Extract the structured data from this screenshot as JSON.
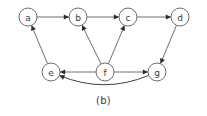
{
  "figure": {
    "caption": "(b)",
    "width": 207,
    "height": 116,
    "background_color": "#ffffff",
    "node_stroke_color": "#6d6d6d",
    "edge_color": "#6f6f6f",
    "arrow_color": "#2b2b2b",
    "label_color": "#3b3b3b"
  },
  "chart_data": {
    "type": "diagram",
    "subtype": "directed-graph",
    "title": "(b)",
    "node_radius": 9,
    "nodes": [
      {
        "id": "a",
        "label": "a",
        "x": 28,
        "y": 17,
        "row": "top"
      },
      {
        "id": "b",
        "label": "b",
        "x": 78,
        "y": 17,
        "row": "top"
      },
      {
        "id": "c",
        "label": "c",
        "x": 128,
        "y": 17,
        "row": "top"
      },
      {
        "id": "d",
        "label": "d",
        "x": 180,
        "y": 17,
        "row": "top"
      },
      {
        "id": "e",
        "label": "e",
        "x": 51,
        "y": 72,
        "row": "bottom"
      },
      {
        "id": "f",
        "label": "f",
        "x": 105,
        "y": 72,
        "row": "bottom"
      },
      {
        "id": "g",
        "label": "g",
        "x": 157,
        "y": 72,
        "row": "bottom"
      }
    ],
    "edges": [
      {
        "from": "a",
        "to": "b",
        "shape": "straight",
        "directed": true
      },
      {
        "from": "b",
        "to": "c",
        "shape": "straight",
        "directed": true
      },
      {
        "from": "c",
        "to": "d",
        "shape": "straight",
        "directed": true
      },
      {
        "from": "e",
        "to": "a",
        "shape": "straight",
        "directed": true
      },
      {
        "from": "f",
        "to": "b",
        "shape": "straight",
        "directed": true
      },
      {
        "from": "f",
        "to": "c",
        "shape": "straight",
        "directed": true
      },
      {
        "from": "d",
        "to": "g",
        "shape": "straight",
        "directed": true
      },
      {
        "from": "f",
        "to": "e",
        "shape": "straight",
        "directed": true
      },
      {
        "from": "f",
        "to": "g",
        "shape": "straight",
        "directed": true
      },
      {
        "from": "g",
        "to": "e",
        "shape": "curved",
        "directed": true,
        "curve_sag": 22
      }
    ]
  }
}
